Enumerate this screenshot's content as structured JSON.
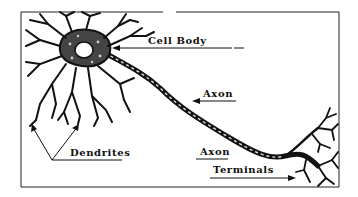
{
  "diagram": {
    "type": "labeled illustration",
    "colors": {
      "ink": "#111111",
      "background": "#ffffff",
      "frame": "#222222"
    },
    "labels": {
      "cell_body": "Cell Body",
      "axon": "Axon",
      "dendrites": "Dendrites",
      "axon_terminals_line1": "Axon",
      "axon_terminals_line2": "Terminals"
    }
  }
}
